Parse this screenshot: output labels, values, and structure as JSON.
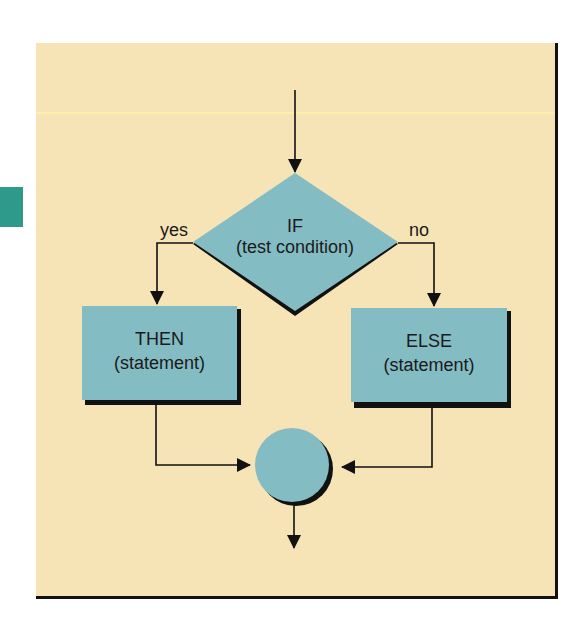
{
  "figure": {
    "type": "flowchart",
    "colors": {
      "background_panel": "#f7e4b6",
      "shape_fill": "#84bcc4",
      "shape_shadow": "#111111",
      "line": "#111111",
      "accent_tab": "#2e9a8a"
    }
  },
  "nodes": {
    "decision": {
      "line1": "IF",
      "line2": "(test condition)"
    },
    "then_box": {
      "line1": "THEN",
      "line2": "(statement)"
    },
    "else_box": {
      "line1": "ELSE",
      "line2": "(statement)"
    },
    "join": {
      "label": ""
    }
  },
  "edges": {
    "yes_label": "yes",
    "no_label": "no"
  }
}
